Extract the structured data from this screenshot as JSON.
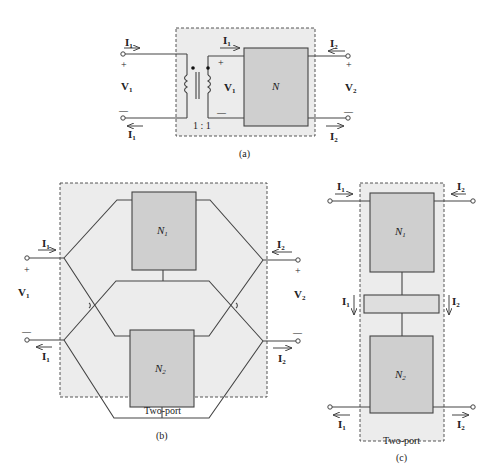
{
  "figure": {
    "panel_a": {
      "caption": "(a)",
      "port1_current_top": "I",
      "port1_current_top_sub": "1",
      "port1_current_bottom": "I",
      "port1_current_bottom_sub": "1",
      "port1_voltage": "V",
      "port1_voltage_sub": "1",
      "plus": "+",
      "minus": "—",
      "inner_current": "I",
      "inner_current_sub": "1",
      "inner_voltage": "V",
      "inner_voltage_sub": "1",
      "turns_ratio": "1 : 1",
      "network_label": "N",
      "port2_current_top": "I",
      "port2_current_top_sub": "2",
      "port2_current_bottom": "I",
      "port2_current_bottom_sub": "2",
      "port2_voltage": "V",
      "port2_voltage_sub": "2"
    },
    "panel_b": {
      "caption": "(b)",
      "region_label": "Two-port",
      "network1_label": "N",
      "network1_sub": "1",
      "network2_label": "N",
      "network2_sub": "2",
      "port1_current": "I",
      "port1_current_sub": "1",
      "port1_voltage": "V",
      "port1_voltage_sub": "1",
      "port2_current": "I",
      "port2_current_sub": "2",
      "port2_voltage": "V",
      "port2_voltage_sub": "2",
      "plus": "+",
      "minus": "—"
    },
    "panel_c": {
      "caption": "(c)",
      "region_label": "Two-port",
      "network1_label": "N",
      "network1_sub": "1",
      "network2_label": "N",
      "network2_sub": "2",
      "top_left_current": "I",
      "top_left_current_sub": "1",
      "top_right_current": "I",
      "top_right_current_sub": "2",
      "mid_left_current": "I",
      "mid_left_current_sub": "1",
      "mid_right_current": "I",
      "mid_right_current_sub": "2",
      "bottom_left_current": "I",
      "bottom_left_current_sub": "1",
      "bottom_right_current": "I",
      "bottom_right_current_sub": "2"
    },
    "colors": {
      "region_fill": "#ececec",
      "box_fill": "#cfcfcf",
      "line": "#444444"
    }
  }
}
